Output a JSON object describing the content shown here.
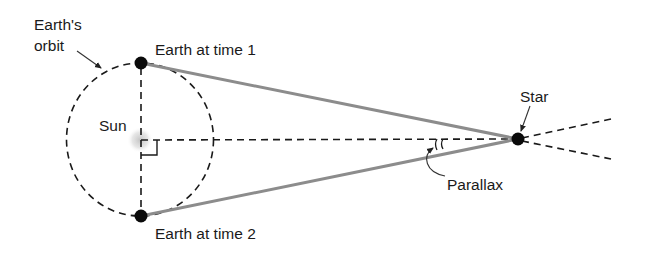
{
  "diagram": {
    "labels": {
      "orbit_line1": "Earth's",
      "orbit_line2": "orbit",
      "sun": "Sun",
      "earth_time1": "Earth at time 1",
      "earth_time2": "Earth at time 2",
      "star": "Star",
      "parallax": "Parallax"
    },
    "colors": {
      "ink": "#1a1a1a",
      "sightline": "#8c8c8c",
      "sun_glow": "#cfcfcf",
      "background": "#ffffff"
    },
    "geometry": {
      "sun": {
        "x": 140,
        "y": 140
      },
      "earth_time1": {
        "x": 141,
        "y": 63
      },
      "earth_time2": {
        "x": 141,
        "y": 216
      },
      "star": {
        "x": 518,
        "y": 139
      },
      "orbit_radius_x": 74,
      "orbit_radius_y": 77
    }
  }
}
